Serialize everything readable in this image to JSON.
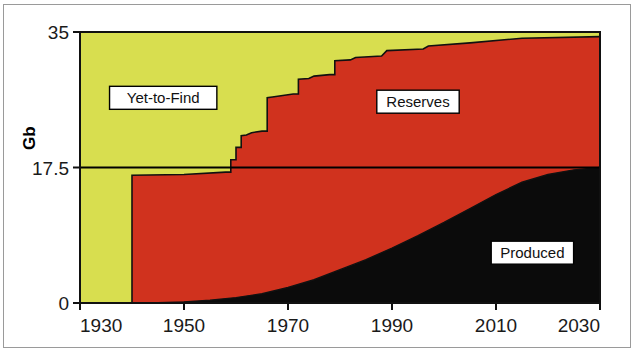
{
  "chart_data": {
    "type": "area",
    "title": "",
    "subtitle": "",
    "xlabel": "",
    "ylabel": "Gb",
    "xlim": [
      1930,
      2030
    ],
    "ylim": [
      0,
      35
    ],
    "grid": false,
    "legend_position": "inline-annotations",
    "stacked": true,
    "x_ticks": [
      "1930",
      "1950",
      "1970",
      "1990",
      "2010",
      "2030"
    ],
    "x_tick_values": [
      1930,
      1950,
      1970,
      1990,
      2010,
      2030
    ],
    "y_ticks": [
      "0",
      "17.5",
      "35"
    ],
    "y_tick_values": [
      0,
      17.5,
      35
    ],
    "reference_lines": [
      {
        "axis": "y",
        "value": 17.5,
        "color": "#000000"
      }
    ],
    "annotations": [
      {
        "text": "Yet-to-Find",
        "x": 1946,
        "y": 26.5
      },
      {
        "text": "Reserves",
        "x": 1995,
        "y": 26.0
      },
      {
        "text": "Produced",
        "x": 2017,
        "y": 6.5
      }
    ],
    "series": [
      {
        "name": "Produced",
        "color": "#0b0b0b",
        "x": [
          1930,
          1940,
          1945,
          1950,
          1955,
          1960,
          1965,
          1970,
          1975,
          1980,
          1985,
          1990,
          1995,
          2000,
          2005,
          2010,
          2015,
          2020,
          2025,
          2030
        ],
        "values": [
          0.0,
          0.0,
          0.05,
          0.15,
          0.35,
          0.7,
          1.2,
          2.0,
          3.0,
          4.3,
          5.6,
          7.1,
          8.7,
          10.4,
          12.2,
          14.0,
          15.6,
          16.6,
          17.2,
          17.5
        ]
      },
      {
        "name": "Reserves",
        "color": "#d0321e",
        "x": [
          1930,
          1939,
          1940,
          1950,
          1958,
          1959,
          1960,
          1961,
          1962,
          1963,
          1965,
          1966,
          1967,
          1968,
          1969,
          1971,
          1972,
          1974,
          1975,
          1978,
          1979,
          1982,
          1983,
          1988,
          1989,
          1996,
          1997,
          2005,
          2015,
          2030
        ],
        "cumulative": [
          0.0,
          0.0,
          16.5,
          16.6,
          16.9,
          18.5,
          20.1,
          21.6,
          21.7,
          22.0,
          22.2,
          26.5,
          26.6,
          26.7,
          26.8,
          27.0,
          28.9,
          29.0,
          29.3,
          29.5,
          31.3,
          31.4,
          31.7,
          31.9,
          32.6,
          32.8,
          33.2,
          33.6,
          34.2,
          34.4
        ]
      },
      {
        "name": "Yet-to-Find",
        "color": "#d8de4f",
        "x": [
          1930,
          2030
        ],
        "cumulative": [
          35.0,
          35.0
        ]
      }
    ]
  },
  "axes": {
    "y_axis_title": "Gb"
  }
}
